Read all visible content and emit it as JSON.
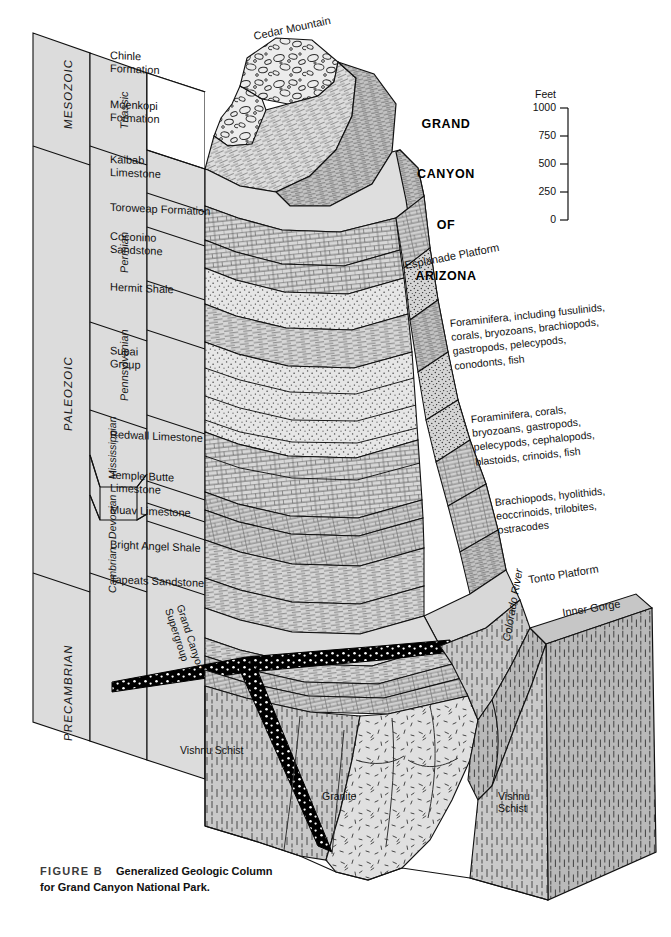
{
  "figure": {
    "label": "FIGURE B",
    "title_line1": "Generalized Geologic Column",
    "title_line2": "for Grand Canyon National Park."
  },
  "title_block": {
    "line1": "GRAND",
    "line2": "CANYON",
    "line3": "OF",
    "line4": "ARIZONA"
  },
  "scale": {
    "caption": "Feet",
    "ticks": [
      "1000",
      "750",
      "500",
      "250",
      "0"
    ],
    "unit": "feet",
    "max": 1000,
    "min": 0,
    "step": 250
  },
  "columns": {
    "era_header": "Era",
    "period_header": "Period",
    "formation_header": "Formation"
  },
  "eras": [
    {
      "name": "MESOZOIC"
    },
    {
      "name": "PALEOZOIC"
    },
    {
      "name": "PRECAMBRIAN"
    }
  ],
  "periods": [
    {
      "name": "Triassic"
    },
    {
      "name": "Permian"
    },
    {
      "name": "Pennsylvanian"
    },
    {
      "name": "Mississippian"
    },
    {
      "name": "Devonian"
    },
    {
      "name": "Cambrian"
    }
  ],
  "formations": [
    {
      "name": "Chinle\nFormation"
    },
    {
      "name": "Moenkopi\nFormation"
    },
    {
      "name": "Kaibab\nLimestone"
    },
    {
      "name": "Toroweap Formation"
    },
    {
      "name": "Coconino\nSandstone"
    },
    {
      "name": "Hermit Shale"
    },
    {
      "name": "Supai\nGroup"
    },
    {
      "name": "Redwall Limestone"
    },
    {
      "name": "Temple Butte\nLimestone"
    },
    {
      "name": "Muav Limestone"
    },
    {
      "name": "Bright Angel Shale"
    },
    {
      "name": "Tapeats Sandstone"
    }
  ],
  "landforms": [
    {
      "name": "Cedar Mountain"
    },
    {
      "name": "Esplanade Platform"
    },
    {
      "name": "Tonto Platform"
    },
    {
      "name": "Inner Gorge"
    },
    {
      "name": "Colorado River"
    }
  ],
  "rock_units": [
    {
      "name": "Grand Canyon\nSupergroup"
    },
    {
      "name": "Vishnu Schist"
    },
    {
      "name": "Granite"
    },
    {
      "name": "Vishnu\nSchist"
    }
  ],
  "fossil_notes": [
    {
      "text": "Foraminifera, including fusulinids,\ncorals, bryozoans, brachiopods,\ngastropods, pelecypods,\nconodonts, fish"
    },
    {
      "text": "Foraminifera, corals,\nbryozoans, gastropods,\npelecypods, cephalopods,\nblastoids, crinoids, fish"
    },
    {
      "text": "Brachiopods, hyolithids,\neoccrinoids, trilobites,\nostracodes"
    }
  ],
  "colors": {
    "background": "#ffffff",
    "panel_fill": "#dcdcdc",
    "rock_light": "#e3e3e3",
    "rock_mid": "#cccccc",
    "rock_dark": "#b5b5b5",
    "ink": "#111111",
    "marker_bed": "#000000"
  }
}
